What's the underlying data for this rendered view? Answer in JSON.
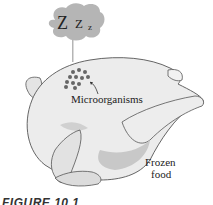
{
  "figure": {
    "caption": "FIGURE 10.1",
    "labels": {
      "microorganisms": "Microorganisms",
      "frozen_food_line1": "Frozen",
      "frozen_food_line2": "food"
    },
    "thought_bubble": {
      "z_large": "Z",
      "z_medium": "Z",
      "z_small": "z"
    },
    "colors": {
      "bubble": "#b5b5b5",
      "chicken_fill": "#ececec",
      "chicken_outline": "#555555",
      "shadow": "#bdbdbd",
      "dots": "#666666"
    }
  }
}
